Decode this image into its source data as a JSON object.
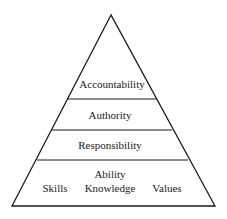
{
  "diagram": {
    "type": "pyramid",
    "levels": [
      {
        "id": "accountability",
        "label": "Accountability"
      },
      {
        "id": "authority",
        "label": "Authority"
      },
      {
        "id": "responsibility",
        "label": "Responsibility"
      },
      {
        "id": "ability",
        "label": "Ability",
        "components": [
          "Skills",
          "Knowledge",
          "Values"
        ]
      }
    ],
    "colors": {
      "stroke": "#1a1a1a",
      "background": "#ffffff"
    }
  }
}
